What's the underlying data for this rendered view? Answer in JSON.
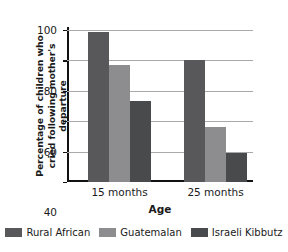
{
  "chart_data": {
    "type": "bar",
    "title": "",
    "xlabel": "Age",
    "ylabel": "Percentage of children who cried following mother's departure",
    "categories": [
      "15 months",
      "25 months"
    ],
    "series": [
      {
        "name": "Rural African",
        "color": "#58585a",
        "values": [
          99,
          80
        ]
      },
      {
        "name": "Guatemalan",
        "color": "#8d8d8f",
        "values": [
          77,
          36
        ]
      },
      {
        "name": "Israeli Kibbutz",
        "color": "#494a4c",
        "values": [
          53,
          19
        ]
      }
    ],
    "ylim": [
      0,
      100
    ],
    "yticks": [
      0,
      20,
      40,
      60,
      80,
      100
    ],
    "ytick_labels": [
      "0",
      "20",
      "40",
      "60",
      "80",
      "100"
    ],
    "grid": "horizontal",
    "legend_position": "bottom"
  },
  "axis": {
    "y_title": "Percentage of children who cried following mother's departure",
    "x_title": "Age",
    "tick_0": "0",
    "tick_20": "20",
    "tick_40": "40",
    "tick_60": "60",
    "tick_80": "80",
    "tick_100": "100"
  },
  "categories": {
    "cat_0": "15 months",
    "cat_1": "25 months"
  },
  "legend": {
    "item_0": "Rural African",
    "item_1": "Guatemalan",
    "item_2": "Israeli Kibbutz"
  },
  "colors": {
    "rural_african": "#58585a",
    "guatemalan": "#8d8d8f",
    "israeli_kibbutz": "#494a4c",
    "axis": "#111111",
    "gridline": "#a9a9a9",
    "background": "#ffffff"
  }
}
